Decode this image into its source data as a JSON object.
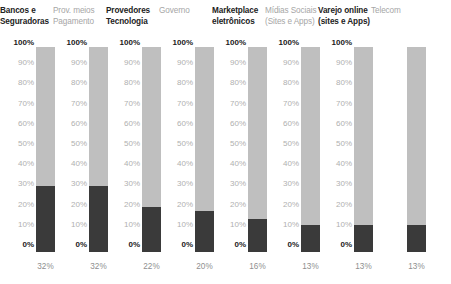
{
  "chart_data": {
    "type": "bar",
    "title": "",
    "xlabel": "",
    "ylabel": "",
    "ylim": [
      0,
      100
    ],
    "grid": false,
    "legend": "none",
    "axis_ticks": [
      "100%",
      "90%",
      "80%",
      "70%",
      "60%",
      "50%",
      "40%",
      "30%",
      "20%",
      "10%",
      "0%"
    ],
    "categories": [
      "Bancos e Seguradoras",
      "Prov. meios Pagamento",
      "Provedores Tecnologia",
      "Governo",
      "Marketplace eletrônicos",
      "Mídias Sociais (Sites e Apps)",
      "Varejo online (sites e Apps)",
      "Telecom"
    ],
    "values": [
      32,
      32,
      22,
      20,
      16,
      13,
      13,
      13
    ],
    "value_labels": [
      "32%",
      "32%",
      "22%",
      "20%",
      "16%",
      "13%",
      "13%",
      "13%"
    ]
  },
  "columns": [
    {
      "header_line1": "Bancos e",
      "header_line2": "Seguradoras",
      "emphasis": "strong",
      "value": 32,
      "value_label": "32%",
      "ticks": [
        "100%",
        "90%",
        "80%",
        "70%",
        "60%",
        "50%",
        "40%",
        "30%",
        "20%",
        "10%",
        "0%"
      ]
    },
    {
      "header_line1": "Prov. meios",
      "header_line2": "Pagamento",
      "emphasis": "muted",
      "value": 32,
      "value_label": "32%",
      "ticks": [
        "100%",
        "90%",
        "80%",
        "70%",
        "60%",
        "50%",
        "40%",
        "30%",
        "20%",
        "10%",
        "0%"
      ]
    },
    {
      "header_line1": "Provedores",
      "header_line2": "Tecnologia",
      "emphasis": "strong",
      "value": 22,
      "value_label": "22%",
      "ticks": [
        "100%",
        "90%",
        "80%",
        "70%",
        "60%",
        "50%",
        "40%",
        "30%",
        "20%",
        "10%",
        "0%"
      ]
    },
    {
      "header_line1": "Governo",
      "header_line2": "",
      "emphasis": "muted",
      "value": 20,
      "value_label": "20%",
      "ticks": [
        "100%",
        "90%",
        "80%",
        "70%",
        "60%",
        "50%",
        "40%",
        "30%",
        "20%",
        "10%",
        "0%"
      ]
    },
    {
      "header_line1": "Marketplace",
      "header_line2": "eletrônicos",
      "emphasis": "strong",
      "value": 16,
      "value_label": "16%",
      "ticks": [
        "100%",
        "90%",
        "80%",
        "70%",
        "60%",
        "50%",
        "40%",
        "30%",
        "20%",
        "10%",
        "0%"
      ]
    },
    {
      "header_line1": "Mídias Sociais",
      "header_line2": "(Sites e Apps)",
      "emphasis": "muted",
      "value": 13,
      "value_label": "13%",
      "ticks": [
        "100%",
        "90%",
        "80%",
        "70%",
        "60%",
        "50%",
        "40%",
        "30%",
        "20%",
        "10%",
        "0%"
      ]
    },
    {
      "header_line1": "Varejo online",
      "header_line2": "(sites e Apps)",
      "emphasis": "strong",
      "value": 13,
      "value_label": "13%",
      "ticks": [
        "100%",
        "90%",
        "80%",
        "70%",
        "60%",
        "50%",
        "40%",
        "30%",
        "20%",
        "10%",
        "0%"
      ]
    },
    {
      "header_line1": "Telecom",
      "header_line2": "",
      "emphasis": "muted",
      "value": 13,
      "value_label": "13%",
      "ticks": []
    }
  ],
  "colors": {
    "bar_track": "#bfbfbf",
    "bar_fill": "#3a3a3a",
    "text_strong": "#222222",
    "text_muted": "#a6a6a6",
    "tick_muted": "#b0b0b0",
    "tick_bold": "#1a1a1a",
    "value_label": "#8f8f8f",
    "background": "#ffffff"
  }
}
